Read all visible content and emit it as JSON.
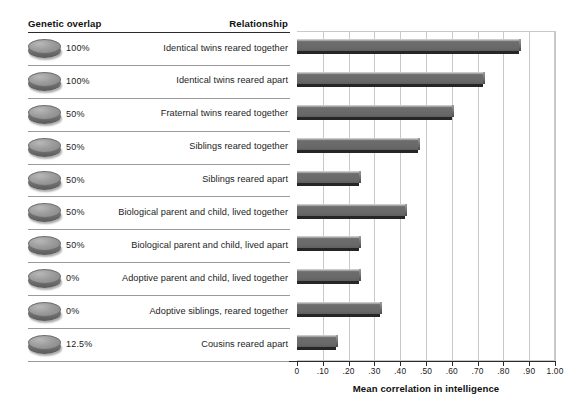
{
  "table": {
    "header_left": "Genetic overlap",
    "header_right": "Relationship",
    "rows": [
      {
        "overlap": "100%",
        "relationship": "Identical twins reared together",
        "value": 0.86
      },
      {
        "overlap": "100%",
        "relationship": "Identical twins reared apart",
        "value": 0.72
      },
      {
        "overlap": "50%",
        "relationship": "Fraternal twins reared together",
        "value": 0.6
      },
      {
        "overlap": "50%",
        "relationship": "Siblings reared together",
        "value": 0.47
      },
      {
        "overlap": "50%",
        "relationship": "Siblings reared apart",
        "value": 0.24
      },
      {
        "overlap": "50%",
        "relationship": "Biological parent and child, lived together",
        "value": 0.42
      },
      {
        "overlap": "50%",
        "relationship": "Biological parent and child, lived apart",
        "value": 0.24
      },
      {
        "overlap": "0%",
        "relationship": "Adoptive parent and child, lived together",
        "value": 0.24
      },
      {
        "overlap": "0%",
        "relationship": "Adoptive siblings, reared together",
        "value": 0.32
      },
      {
        "overlap": "12.5%",
        "relationship": "Cousins reared apart",
        "value": 0.15
      }
    ]
  },
  "chart_data": {
    "type": "bar",
    "orientation": "horizontal",
    "title": "",
    "xlabel": "Mean correlation in intelligence",
    "ylabel": "",
    "xlim": [
      0,
      1.0
    ],
    "grid": true,
    "legend": "none",
    "tick_labels": [
      "0",
      ".10",
      ".20",
      ".30",
      ".40",
      ".50",
      ".60",
      ".70",
      ".80",
      ".90",
      "1.00"
    ],
    "tick_values": [
      0,
      0.1,
      0.2,
      0.3,
      0.4,
      0.5,
      0.6,
      0.7,
      0.8,
      0.9,
      1.0
    ],
    "categories": [
      "Identical twins reared together",
      "Identical twins reared apart",
      "Fraternal twins reared together",
      "Siblings reared together",
      "Siblings reared apart",
      "Biological parent and child, lived together",
      "Biological parent and child, lived apart",
      "Adoptive parent and child, lived together",
      "Adoptive siblings, reared together",
      "Cousins reared apart"
    ],
    "values": [
      0.86,
      0.72,
      0.6,
      0.47,
      0.24,
      0.42,
      0.24,
      0.24,
      0.32,
      0.15
    ],
    "genetic_overlap": [
      "100%",
      "100%",
      "50%",
      "50%",
      "50%",
      "50%",
      "50%",
      "0%",
      "0%",
      "12.5%"
    ],
    "bar_color": "#6d6d6d",
    "grid_color": "#c9c9c9",
    "axis_color": "#2b2b2b"
  },
  "icons": {
    "disc": "genetic-overlap-disc-icon"
  }
}
